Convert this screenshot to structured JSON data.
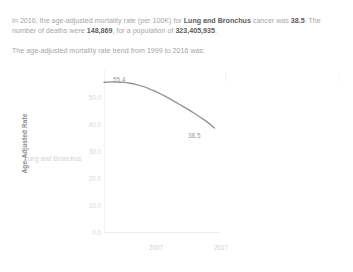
{
  "narrative": {
    "line1_a": "In 2016, the age-adjusted mortality rate (per 100K) for ",
    "line1_cancer": "Lung and Bronchus",
    "line1_b": " cancer was ",
    "rate": "38.5",
    "line1_c": ". The number of deaths were ",
    "deaths": "148,869",
    "line1_d": ", for a population of ",
    "population": "323,405,935",
    "line1_e": ".",
    "line2": "The age-adjusted mortality rate trend from 1999 to 2016 was:"
  },
  "row_label": "Lung and Bronchus",
  "chart_data": {
    "type": "line",
    "title": "",
    "xlabel": "",
    "ylabel": "Age-Adjusted Rate",
    "ylim": [
      0.0,
      60.0
    ],
    "xlim": [
      1999,
      2019
    ],
    "grid": false,
    "legend": "none",
    "line_color": "#7b7b7b",
    "yticks": [
      "0.0",
      "10.0",
      "20.0",
      "30.0",
      "40.0",
      "50.0"
    ],
    "ytick_values": [
      0.0,
      10.0,
      20.0,
      30.0,
      40.0,
      50.0
    ],
    "xticks": [
      "2007",
      "2017"
    ],
    "xtick_values": [
      2007,
      2017
    ],
    "x": [
      1999,
      2000,
      2001,
      2002,
      2003,
      2004,
      2005,
      2006,
      2007,
      2008,
      2009,
      2010,
      2011,
      2012,
      2013,
      2014,
      2015,
      2016
    ],
    "values": [
      55.4,
      55.6,
      55.5,
      55.4,
      55.1,
      54.6,
      53.9,
      53.0,
      52.0,
      50.8,
      49.5,
      48.1,
      46.7,
      45.3,
      43.8,
      42.2,
      40.5,
      38.5
    ],
    "annotations": [
      {
        "name": "start-value",
        "text": "55.4",
        "x": 1999,
        "y": 55.4
      },
      {
        "name": "end-value",
        "text": "38.5",
        "x": 2016,
        "y": 38.5
      }
    ]
  }
}
